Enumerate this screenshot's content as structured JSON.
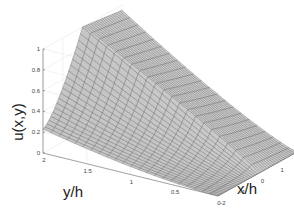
{
  "chart_data": {
    "type": "surface3d",
    "title": "",
    "xlabel": "x/h",
    "ylabel": "y/h",
    "zlabel": "u(x,y)",
    "x_ticks": [
      "-2",
      "-1",
      "0",
      "1",
      "2"
    ],
    "y_ticks": [
      "0",
      "0.5",
      "1",
      "1.5",
      "2"
    ],
    "z_ticks": [
      "0",
      "0.2",
      "0.4",
      "0.6",
      "0.8",
      "1"
    ],
    "xlim": [
      -2,
      2
    ],
    "ylim": [
      0,
      2
    ],
    "zlim": [
      0,
      1
    ],
    "grid": true,
    "colormap": "gray",
    "sample_points": [
      {
        "x": -2,
        "y": 0,
        "z": 0.0
      },
      {
        "x": -2,
        "y": 1,
        "z": 0.1
      },
      {
        "x": -2,
        "y": 2,
        "z": 0.23
      },
      {
        "x": -1,
        "y": 2,
        "z": 0.75
      },
      {
        "x": 0,
        "y": 2,
        "z": 1.0
      },
      {
        "x": 0,
        "y": 1,
        "z": 0.6
      },
      {
        "x": 0,
        "y": 0,
        "z": 0.0
      },
      {
        "x": 2,
        "y": 2,
        "z": 1.0
      },
      {
        "x": 2,
        "y": 1,
        "z": 0.5
      },
      {
        "x": 2,
        "y": 0,
        "z": 0.0
      }
    ]
  },
  "labels": {
    "z_axis": "u(x,y)",
    "y_axis": "y/h",
    "x_axis": "x/h"
  }
}
